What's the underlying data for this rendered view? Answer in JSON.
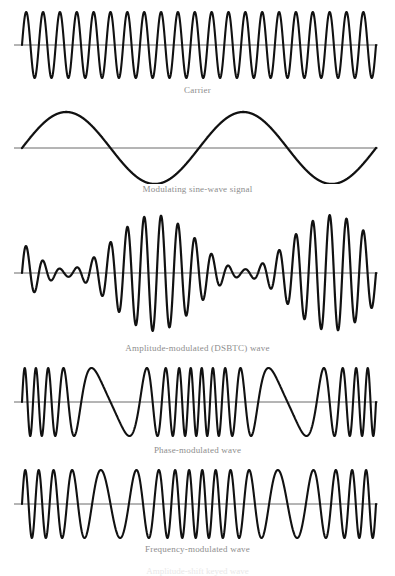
{
  "figure": {
    "background_color": "#ffffff",
    "wave_color": "#111111",
    "axis_color": "#6b6b6b",
    "caption_color": "#8d8d8d",
    "width": 395,
    "height": 573
  },
  "panels": [
    {
      "id": "carrier",
      "caption": "Carrier",
      "caption_font_size": 9,
      "caption_y": 85,
      "panel_top": 4,
      "panel_height": 78,
      "x_start": 22,
      "x_end": 376,
      "baseline_y": 41,
      "amplitude": 33,
      "axis_y": 41,
      "axis_x_start": 14,
      "axis_x_end": 378,
      "stroke_width": 2.1,
      "type": "carrier",
      "cycles": 21,
      "phase": 0
    },
    {
      "id": "modulating-signal",
      "caption": "Modulating sine-wave signal",
      "caption_font_size": 9,
      "caption_y": 184,
      "panel_top": 104,
      "panel_height": 80,
      "x_start": 22,
      "x_end": 376,
      "baseline_y": 44,
      "amplitude": 36,
      "axis_y": 44,
      "axis_x_start": 14,
      "axis_x_end": 378,
      "stroke_width": 2.3,
      "type": "carrier",
      "cycles": 2,
      "phase": 0
    },
    {
      "id": "amplitude-modulated",
      "caption": "Amplitude-modulated (DSBTC) wave",
      "caption_font_size": 9,
      "caption_y": 343,
      "panel_top": 208,
      "panel_height": 132,
      "x_start": 22,
      "x_end": 376,
      "baseline_y": 65,
      "amplitude": 58,
      "axis_y": 65,
      "axis_x_start": 14,
      "axis_x_end": 378,
      "stroke_width": 2.2,
      "type": "am",
      "cycles": 21,
      "phase": 0,
      "envelope_cycles": 2,
      "envelope_phase": 0,
      "modulation_index": 0.88
    },
    {
      "id": "phase-modulated",
      "caption": "Phase-modulated wave",
      "caption_font_size": 9,
      "caption_y": 445,
      "panel_top": 362,
      "panel_height": 80,
      "x_start": 22,
      "x_end": 376,
      "baseline_y": 40,
      "amplitude": 34,
      "axis_y": 40,
      "axis_x_start": 14,
      "axis_x_end": 378,
      "stroke_width": 2.1,
      "type": "pm",
      "cycles": 18,
      "phase": 0,
      "mod_cycles": 2,
      "mod_phase": 0,
      "deviation": 7.2
    },
    {
      "id": "frequency-modulated",
      "caption": "Frequency-modulated wave",
      "caption_font_size": 9,
      "caption_y": 544,
      "panel_top": 464,
      "panel_height": 78,
      "x_start": 22,
      "x_end": 376,
      "baseline_y": 40,
      "amplitude": 34,
      "axis_y": 40,
      "axis_x_start": 14,
      "axis_x_end": 378,
      "stroke_width": 2.1,
      "type": "fm",
      "cycles": 18,
      "phase": 0,
      "mod_cycles": 2,
      "mod_phase": 0.25,
      "deviation": 9.0
    }
  ],
  "bottom_clipped_caption": {
    "text": "Amplitude-shift keyed wave",
    "font_size": 9,
    "y": 566
  },
  "chart_data": {
    "type": "line",
    "xlabel": "",
    "ylabel": "",
    "grid": false,
    "legend": "none",
    "series": [
      {
        "name": "Carrier",
        "description": "Constant-amplitude, constant-frequency sinusoid",
        "cycles": 21,
        "amplitude": 1.0
      },
      {
        "name": "Modulating sine-wave signal",
        "description": "Low-frequency sinusoid used to modulate the carrier",
        "cycles": 2,
        "amplitude": 1.0
      },
      {
        "name": "Amplitude-modulated (DSBTC) wave",
        "description": "Carrier amplitude varies with the modulating signal; double sideband transmitted carrier",
        "cycles": 21,
        "envelope_cycles": 2,
        "modulation_index": 0.88
      },
      {
        "name": "Phase-modulated wave",
        "description": "Carrier phase varies with the modulating signal; dense clusters at start, middle and end",
        "cycles": 18,
        "mod_cycles": 2,
        "deviation": 7.2
      },
      {
        "name": "Frequency-modulated wave",
        "description": "Carrier frequency varies with the modulating signal; two compressed high-frequency zones",
        "cycles": 18,
        "mod_cycles": 2,
        "deviation": 9.0
      }
    ]
  }
}
